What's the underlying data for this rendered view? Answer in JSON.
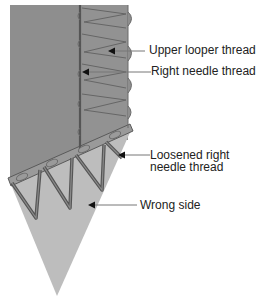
{
  "figure": {
    "type": "sewing stitch diagram",
    "colors": {
      "fabric_right_side": "#8e8e8e",
      "fabric_wrong_side": "#bdbdbd",
      "thread": "#5a5a5a",
      "leader_line": "#777777",
      "label_text": "#222222"
    }
  },
  "labels": {
    "upper_looper": "Upper looper thread",
    "right_needle": "Right needle thread",
    "loosened_line1": "Loosened right",
    "loosened_line2": "needle thread",
    "wrong_side": "Wrong side"
  }
}
